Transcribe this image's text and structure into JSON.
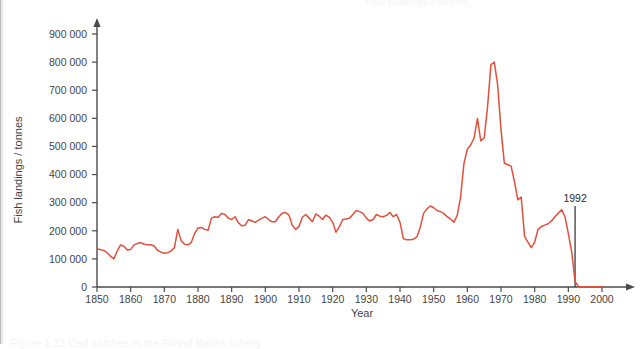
{
  "page": {
    "ghost_title": "Fish landings / tonnes",
    "ghost_caption": "Figure 1.23  Cod catches in the Grand Banks fishery"
  },
  "chart_data": {
    "type": "line",
    "title": "",
    "xlabel": "Year",
    "ylabel": "Fish landings / tonnes",
    "xlim": [
      1850,
      2000
    ],
    "ylim": [
      0,
      900000
    ],
    "grid": false,
    "legend": null,
    "line_color": "#e0503c",
    "axis_color": "#4a4a4a",
    "x_ticks": [
      1850,
      1860,
      1870,
      1880,
      1890,
      1900,
      1910,
      1920,
      1930,
      1940,
      1950,
      1960,
      1970,
      1980,
      1990,
      2000
    ],
    "x_tick_labels": [
      "1850",
      "1860",
      "1870",
      "1880",
      "1890",
      "1900",
      "1910",
      "1920",
      "1930",
      "1940",
      "1950",
      "1960",
      "1970",
      "1980",
      "1990",
      "2000"
    ],
    "y_ticks": [
      0,
      100000,
      200000,
      300000,
      400000,
      500000,
      600000,
      700000,
      800000,
      900000
    ],
    "y_tick_labels": [
      "0",
      "100 000",
      "200 000",
      "300 000",
      "400 000",
      "500 000",
      "600 000",
      "700 000",
      "800 000",
      "900 000"
    ],
    "annotations": [
      {
        "label": "1992",
        "x": 1992,
        "y_top": 880000,
        "type": "vertical-line",
        "color": "#2b2b2b"
      }
    ],
    "series": [
      {
        "name": "Fish landings",
        "color": "#e0503c",
        "x": [
          1850,
          1851,
          1852,
          1853,
          1854,
          1855,
          1856,
          1857,
          1858,
          1859,
          1860,
          1861,
          1862,
          1863,
          1864,
          1865,
          1866,
          1867,
          1868,
          1869,
          1870,
          1871,
          1872,
          1873,
          1874,
          1875,
          1876,
          1877,
          1878,
          1879,
          1880,
          1881,
          1882,
          1883,
          1884,
          1885,
          1886,
          1887,
          1888,
          1889,
          1890,
          1891,
          1892,
          1893,
          1894,
          1895,
          1896,
          1897,
          1898,
          1899,
          1900,
          1901,
          1902,
          1903,
          1904,
          1905,
          1906,
          1907,
          1908,
          1909,
          1910,
          1911,
          1912,
          1913,
          1914,
          1915,
          1916,
          1917,
          1918,
          1919,
          1920,
          1921,
          1922,
          1923,
          1924,
          1925,
          1926,
          1927,
          1928,
          1929,
          1930,
          1931,
          1932,
          1933,
          1934,
          1935,
          1936,
          1937,
          1938,
          1939,
          1940,
          1941,
          1942,
          1943,
          1944,
          1945,
          1946,
          1947,
          1948,
          1949,
          1950,
          1951,
          1952,
          1953,
          1954,
          1955,
          1956,
          1957,
          1958,
          1959,
          1960,
          1961,
          1962,
          1963,
          1964,
          1965,
          1966,
          1967,
          1968,
          1969,
          1970,
          1971,
          1972,
          1973,
          1974,
          1975,
          1976,
          1977,
          1978,
          1979,
          1980,
          1981,
          1982,
          1983,
          1984,
          1985,
          1986,
          1987,
          1988,
          1989,
          1990,
          1991,
          1992,
          1993,
          1994,
          1995,
          1996,
          1997,
          1998,
          1999,
          2000
        ],
        "values": [
          135000,
          133000,
          130000,
          122000,
          110000,
          100000,
          128000,
          150000,
          145000,
          132000,
          133000,
          150000,
          155000,
          158000,
          152000,
          150000,
          150000,
          146000,
          130000,
          124000,
          120000,
          122000,
          128000,
          140000,
          205000,
          165000,
          152000,
          150000,
          158000,
          190000,
          210000,
          212000,
          205000,
          202000,
          245000,
          250000,
          248000,
          262000,
          258000,
          245000,
          240000,
          250000,
          228000,
          218000,
          220000,
          240000,
          235000,
          230000,
          238000,
          245000,
          250000,
          240000,
          232000,
          232000,
          250000,
          262000,
          265000,
          256000,
          220000,
          205000,
          215000,
          248000,
          258000,
          245000,
          232000,
          260000,
          252000,
          240000,
          256000,
          248000,
          230000,
          195000,
          215000,
          240000,
          242000,
          245000,
          258000,
          272000,
          268000,
          262000,
          245000,
          235000,
          240000,
          258000,
          252000,
          250000,
          255000,
          265000,
          250000,
          258000,
          230000,
          172000,
          168000,
          168000,
          170000,
          178000,
          212000,
          262000,
          278000,
          288000,
          282000,
          272000,
          268000,
          262000,
          250000,
          242000,
          230000,
          255000,
          320000,
          440000,
          490000,
          505000,
          530000,
          600000,
          520000,
          530000,
          640000,
          790000,
          800000,
          720000,
          560000,
          440000,
          435000,
          430000,
          375000,
          310000,
          320000,
          180000,
          160000,
          140000,
          160000,
          205000,
          215000,
          220000,
          225000,
          235000,
          250000,
          262000,
          275000,
          250000,
          190000,
          125000,
          20000,
          1000,
          1000,
          1000,
          1000,
          1000,
          1000,
          1000,
          1000
        ]
      }
    ]
  }
}
